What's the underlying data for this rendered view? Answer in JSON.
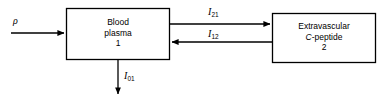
{
  "diagram": {
    "type": "two-compartment-model",
    "background_color": "#ffffff",
    "stroke_color": "#000000",
    "compartments": [
      {
        "id": "1",
        "name": "blood-plasma-compartment",
        "line1": "Blood",
        "line2": "plasma",
        "number": "1"
      },
      {
        "id": "2",
        "name": "extravascular-c-peptide-compartment",
        "line1": "Extravascular",
        "line2_italic": "C",
        "line2_rest": "-peptide",
        "number": "2"
      }
    ],
    "flows": [
      {
        "name": "input-flow",
        "symbol": "ρ",
        "subscript": "",
        "direction": "into-compartment-1"
      },
      {
        "name": "flow-1-to-2",
        "symbol": "I",
        "subscript": "21",
        "direction": "compartment-1-to-compartment-2"
      },
      {
        "name": "flow-2-to-1",
        "symbol": "I",
        "subscript": "12",
        "direction": "compartment-2-to-compartment-1"
      },
      {
        "name": "elimination-flow",
        "symbol": "I",
        "subscript": "01",
        "direction": "out-of-compartment-1"
      }
    ]
  }
}
